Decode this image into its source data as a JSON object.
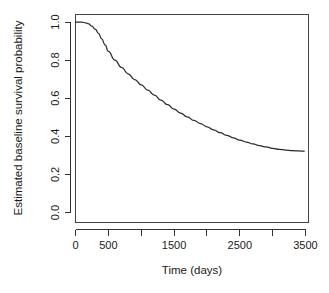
{
  "chart_data": {
    "type": "line",
    "title": "",
    "xlabel": "Time (days)",
    "ylabel": "Estimated baseline survival probability",
    "xlim": [
      0,
      3500
    ],
    "ylim": [
      0.0,
      1.0
    ],
    "grid": false,
    "legend": null,
    "legend_position": "none",
    "line_color": "#2b2b2b",
    "background_color": "#ffffff",
    "axis_color": "#333333",
    "xticks": [
      0,
      500,
      1000,
      1500,
      2000,
      2500,
      3000,
      3500
    ],
    "xtick_labels": [
      "0",
      "500",
      "",
      "1500",
      "",
      "2500",
      "",
      "3500"
    ],
    "yticks": [
      0.0,
      0.2,
      0.4,
      0.6,
      0.8,
      1.0
    ],
    "ytick_labels": [
      "0.0",
      "0.2",
      "0.4",
      "0.6",
      "0.8",
      "1.0"
    ],
    "series": [
      {
        "name": "baseline survival",
        "x": [
          0,
          50,
          100,
          150,
          200,
          250,
          300,
          350,
          400,
          450,
          500,
          600,
          700,
          800,
          900,
          1000,
          1100,
          1200,
          1300,
          1400,
          1500,
          1600,
          1700,
          1800,
          1900,
          2000,
          2100,
          2200,
          2300,
          2400,
          2500,
          2600,
          2700,
          2800,
          2900,
          3000,
          3100,
          3200,
          3300,
          3400,
          3480
        ],
        "y": [
          1.0,
          1.0,
          0.999,
          0.996,
          0.99,
          0.978,
          0.962,
          0.94,
          0.912,
          0.88,
          0.846,
          0.8,
          0.762,
          0.728,
          0.698,
          0.67,
          0.642,
          0.616,
          0.59,
          0.566,
          0.543,
          0.522,
          0.502,
          0.484,
          0.467,
          0.45,
          0.434,
          0.419,
          0.405,
          0.392,
          0.38,
          0.37,
          0.36,
          0.351,
          0.344,
          0.337,
          0.332,
          0.328,
          0.325,
          0.323,
          0.322
        ]
      }
    ]
  }
}
